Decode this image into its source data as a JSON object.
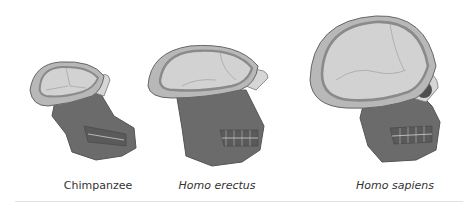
{
  "figure": {
    "specimens": [
      {
        "name": "Chimpanzee",
        "italic": false
      },
      {
        "name": "Homo erectus",
        "italic": true
      },
      {
        "name": "Homo sapiens",
        "italic": true
      }
    ]
  },
  "colors": {
    "cranium_fill": "#c9c9c9",
    "cranium_rim": "#8a8a8a",
    "face_fill": "#6b6b6b",
    "face_dark": "#4e4e4e",
    "outline": "#555555",
    "label_text": "#333333",
    "divider": "#e2e2e2"
  }
}
